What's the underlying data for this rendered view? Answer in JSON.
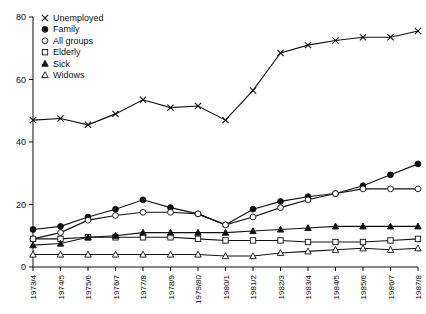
{
  "chart_data": {
    "type": "line",
    "title": "",
    "subtitle": "",
    "xlabel": "",
    "ylabel": "",
    "grid": false,
    "legend_position": "top-left",
    "ylim": [
      0,
      80
    ],
    "yticks": [
      0,
      20,
      40,
      60,
      80
    ],
    "categories": [
      "1973/4",
      "1974/5",
      "1975/6",
      "1976/7",
      "1977/8",
      "1978/9",
      "1979/80",
      "1980/1",
      "1981/2",
      "1982/3",
      "1983/4",
      "1984/5",
      "1985/6",
      "1986/7",
      "1987/8"
    ],
    "series": [
      {
        "name": "Unemployed",
        "marker": "cross",
        "values": [
          47,
          47.5,
          45.5,
          49,
          53.5,
          51,
          51.5,
          47,
          56.5,
          68.5,
          71,
          72.5,
          73.5,
          73.5,
          75.5
        ]
      },
      {
        "name": "Family",
        "marker": "filled-circle",
        "values": [
          12,
          13,
          16,
          18.5,
          21.5,
          19,
          17,
          13.5,
          18.5,
          21,
          22.5,
          23.5,
          26,
          29.5,
          33
        ]
      },
      {
        "name": "All groups",
        "marker": "open-circle",
        "values": [
          9,
          11,
          15,
          16.5,
          17.5,
          17.5,
          17,
          13.5,
          16,
          19,
          21.5,
          23.5,
          25,
          25,
          25
        ]
      },
      {
        "name": "Elderly",
        "marker": "open-square",
        "values": [
          9,
          9,
          9.5,
          9.5,
          9.5,
          9.5,
          9,
          8.5,
          8.5,
          8.5,
          8,
          8,
          8,
          8.5,
          9
        ]
      },
      {
        "name": "Sick",
        "marker": "filled-triangle",
        "values": [
          7,
          7.5,
          9.5,
          10,
          11,
          11,
          11,
          11,
          11.5,
          12,
          12.5,
          13,
          13,
          13,
          13
        ]
      },
      {
        "name": "Widows",
        "marker": "open-triangle",
        "values": [
          4,
          4,
          4,
          4,
          4,
          4,
          4,
          3.5,
          3.5,
          4.5,
          5,
          5.5,
          6,
          5.5,
          6
        ]
      }
    ]
  },
  "legend": {
    "items": [
      {
        "label": "Unemployed",
        "marker": "cross"
      },
      {
        "label": "Family",
        "marker": "filled-circle"
      },
      {
        "label": "All groups",
        "marker": "open-circle"
      },
      {
        "label": "Elderly",
        "marker": "open-square"
      },
      {
        "label": "Sick",
        "marker": "filled-triangle"
      },
      {
        "label": "Widows",
        "marker": "open-triangle"
      }
    ]
  },
  "colors": {
    "ink": "#111111",
    "background": "#ffffff"
  }
}
